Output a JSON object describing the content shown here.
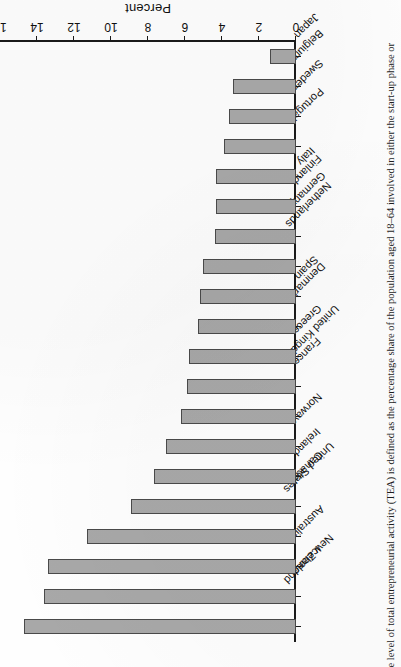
{
  "page": {
    "orientation": "rotated-180",
    "caption": "e level of total entrepreneurial activity (TEA) is defined as the percentage share of the population aged 18–64 involved in either the start-up phase or"
  },
  "chart_data": {
    "type": "bar",
    "orientation": "horizontal",
    "title": "",
    "xlabel": "Percent",
    "ylabel": "",
    "categories": [
      "New Zealand",
      "Iceland",
      "Australia",
      "United States",
      "Canada",
      "Ireland",
      "Norway",
      "United Kingdom",
      "France",
      "Greece",
      "Denmark",
      "Spain",
      "Netherlands",
      "Germany",
      "Finland",
      "Italy",
      "Portugal",
      "Sweden",
      "Belgium",
      "Japan"
    ],
    "values": [
      14.7,
      13.6,
      13.4,
      11.3,
      8.9,
      7.7,
      7.0,
      6.2,
      5.9,
      5.8,
      5.3,
      5.2,
      5.0,
      4.4,
      4.3,
      4.3,
      3.9,
      3.6,
      3.4,
      1.4
    ],
    "xlim": [
      0,
      16
    ],
    "xticks": [
      0,
      2,
      4,
      6,
      8,
      10,
      12,
      14,
      16
    ],
    "ticklabels": [
      "0",
      "2",
      "4",
      "6",
      "8",
      "10",
      "12",
      "14",
      "16"
    ],
    "grid": false,
    "legend": null,
    "bar_color": "#a8a8a8",
    "bar_edge_color": "#4a4a4a",
    "axis_color": "#1a1a1a"
  }
}
